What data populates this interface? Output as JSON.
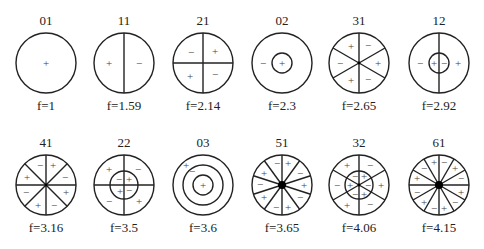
{
  "diagram": {
    "radius": 30,
    "modes": [
      {
        "id": "01",
        "freq": "f=1",
        "cx": 46,
        "cy": 63,
        "row": 1,
        "diameters": 0,
        "rings": [],
        "angle0": 90,
        "hub": false,
        "signs": [
          {
            "s": "+",
            "dx": 0,
            "dy": 0
          }
        ]
      },
      {
        "id": "11",
        "freq": "f=1.59",
        "cx": 124,
        "cy": 63,
        "row": 1,
        "diameters": 1,
        "rings": [],
        "angle0": 90,
        "hub": false,
        "signs": [
          {
            "s": "+",
            "dx": -15,
            "dy": 0
          },
          {
            "s": "−",
            "dx": 15,
            "dy": 0
          }
        ]
      },
      {
        "id": "21",
        "freq": "f=2.14",
        "cx": 203,
        "cy": 63,
        "row": 1,
        "diameters": 2,
        "rings": [],
        "angle0": 90,
        "hub": false,
        "signs": [
          {
            "s": "−",
            "dx": -12,
            "dy": -11
          },
          {
            "s": "+",
            "dx": 12,
            "dy": -12
          },
          {
            "s": "+",
            "dx": -13,
            "dy": 13
          },
          {
            "s": "−",
            "dx": 12,
            "dy": 11
          }
        ]
      },
      {
        "id": "02",
        "freq": "f=2.3",
        "cx": 282,
        "cy": 63,
        "row": 1,
        "diameters": 0,
        "rings": [
          10
        ],
        "angle0": 90,
        "hub": false,
        "signs": [
          {
            "s": "−",
            "dx": -19,
            "dy": 0
          },
          {
            "s": "+",
            "dx": 0,
            "dy": 0
          }
        ]
      },
      {
        "id": "31",
        "freq": "f=2.65",
        "cx": 359,
        "cy": 63,
        "row": 1,
        "diameters": 3,
        "rings": [],
        "angle0": 90,
        "hub": false,
        "signs": [
          {
            "s": "+",
            "dx": -8,
            "dy": -17
          },
          {
            "s": "−",
            "dx": 9,
            "dy": -18
          },
          {
            "s": "−",
            "dx": -19,
            "dy": 0
          },
          {
            "s": "+",
            "dx": 19,
            "dy": 0
          },
          {
            "s": "+",
            "dx": -8,
            "dy": 17
          },
          {
            "s": "−",
            "dx": 9,
            "dy": 16
          }
        ]
      },
      {
        "id": "12",
        "freq": "f=2.92",
        "cx": 439,
        "cy": 63,
        "row": 1,
        "diameters": 1,
        "rings": [
          10
        ],
        "angle0": 90,
        "hub": false,
        "signs": [
          {
            "s": "−",
            "dx": -19,
            "dy": 0
          },
          {
            "s": "+",
            "dx": -5,
            "dy": 0
          },
          {
            "s": "−",
            "dx": 5,
            "dy": 0
          },
          {
            "s": "+",
            "dx": 19,
            "dy": 0
          }
        ]
      },
      {
        "id": "41",
        "freq": "f=3.16",
        "cx": 46,
        "cy": 185,
        "row": 2,
        "diameters": 4,
        "rings": [],
        "angle0": 90,
        "hub": false,
        "signs": [
          {
            "s": "−",
            "dx": -6,
            "dy": -20
          },
          {
            "s": "+",
            "dx": 7,
            "dy": -20
          },
          {
            "s": "+",
            "dx": -19,
            "dy": -8
          },
          {
            "s": "−",
            "dx": 19,
            "dy": -8
          },
          {
            "s": "−",
            "dx": -20,
            "dy": 7
          },
          {
            "s": "+",
            "dx": 20,
            "dy": 7
          },
          {
            "s": "+",
            "dx": -8,
            "dy": 20
          },
          {
            "s": "−",
            "dx": 8,
            "dy": 20
          }
        ]
      },
      {
        "id": "22",
        "freq": "f=3.5",
        "cx": 124,
        "cy": 185,
        "row": 2,
        "diameters": 2,
        "rings": [
          14
        ],
        "angle0": 90,
        "hub": false,
        "signs": [
          {
            "s": "+",
            "dx": -15,
            "dy": -16
          },
          {
            "s": "−",
            "dx": 14,
            "dy": -16
          },
          {
            "s": "−",
            "dx": -5,
            "dy": -6
          },
          {
            "s": "+",
            "dx": 5,
            "dy": -6
          },
          {
            "s": "+",
            "dx": -4,
            "dy": 6
          },
          {
            "s": "−",
            "dx": 5,
            "dy": 5
          },
          {
            "s": "−",
            "dx": -15,
            "dy": 16
          },
          {
            "s": "+",
            "dx": 15,
            "dy": 16
          }
        ]
      },
      {
        "id": "03",
        "freq": "f=3.6",
        "cx": 203,
        "cy": 185,
        "row": 2,
        "diameters": 0,
        "rings": [
          20,
          10
        ],
        "angle0": 90,
        "hub": false,
        "signs": [
          {
            "s": "+",
            "dx": -17,
            "dy": -20
          },
          {
            "s": "−",
            "dx": -11,
            "dy": -14
          },
          {
            "s": "+",
            "dx": 0,
            "dy": 0
          }
        ]
      },
      {
        "id": "51",
        "freq": "f=3.65",
        "cx": 282,
        "cy": 185,
        "row": 2,
        "diameters": 5,
        "rings": [],
        "angle0": 90,
        "hub": true,
        "signs": [
          {
            "s": "−",
            "dx": -5,
            "dy": -22
          },
          {
            "s": "+",
            "dx": 6,
            "dy": -22
          },
          {
            "s": "+",
            "dx": -18,
            "dy": -12
          },
          {
            "s": "−",
            "dx": 18,
            "dy": -12
          },
          {
            "s": "−",
            "dx": -22,
            "dy": -1
          },
          {
            "s": "+",
            "dx": 22,
            "dy": 0
          },
          {
            "s": "+",
            "dx": -18,
            "dy": 12
          },
          {
            "s": "−",
            "dx": 18,
            "dy": 12
          },
          {
            "s": "−",
            "dx": -6,
            "dy": 22
          },
          {
            "s": "+",
            "dx": 6,
            "dy": 22
          }
        ]
      },
      {
        "id": "32",
        "freq": "f=4.06",
        "cx": 359,
        "cy": 185,
        "row": 2,
        "diameters": 3,
        "rings": [
          14
        ],
        "angle0": 90,
        "hub": false,
        "signs": [
          {
            "s": "+",
            "dx": -12,
            "dy": -20
          },
          {
            "s": "−",
            "dx": 11,
            "dy": -20
          },
          {
            "s": "−",
            "dx": -22,
            "dy": 0
          },
          {
            "s": "+",
            "dx": 22,
            "dy": 0
          },
          {
            "s": "+",
            "dx": -12,
            "dy": 20
          },
          {
            "s": "−",
            "dx": 11,
            "dy": 19
          },
          {
            "s": "−",
            "dx": -4,
            "dy": -9
          },
          {
            "s": "+",
            "dx": 5,
            "dy": -9
          },
          {
            "s": "+",
            "dx": -9,
            "dy": 0
          },
          {
            "s": "−",
            "dx": 9,
            "dy": 0
          },
          {
            "s": "−",
            "dx": -4,
            "dy": 9
          },
          {
            "s": "+",
            "dx": 5,
            "dy": 9
          }
        ]
      },
      {
        "id": "61",
        "freq": "f=4.15",
        "cx": 439,
        "cy": 185,
        "row": 2,
        "diameters": 6,
        "rings": [],
        "angle0": 90,
        "hub": true,
        "signs": [
          {
            "s": "+",
            "dx": -5,
            "dy": -23
          },
          {
            "s": "−",
            "dx": 5,
            "dy": -23
          },
          {
            "s": "−",
            "dx": -15,
            "dy": -17
          },
          {
            "s": "+",
            "dx": 16,
            "dy": -17
          },
          {
            "s": "+",
            "dx": -22,
            "dy": -7
          },
          {
            "s": "−",
            "dx": 22,
            "dy": -7
          },
          {
            "s": "−",
            "dx": -22,
            "dy": 7
          },
          {
            "s": "+",
            "dx": 22,
            "dy": 7
          },
          {
            "s": "+",
            "dx": -15,
            "dy": 17
          },
          {
            "s": "−",
            "dx": 16,
            "dy": 17
          },
          {
            "s": "−",
            "dx": -5,
            "dy": 23
          },
          {
            "s": "+",
            "dx": 5,
            "dy": 23
          }
        ]
      }
    ]
  }
}
